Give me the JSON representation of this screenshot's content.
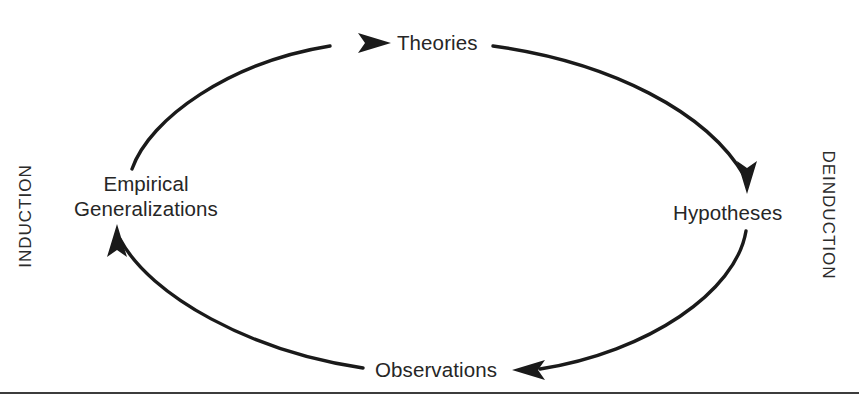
{
  "diagram": {
    "background_color": "#ffffff",
    "stroke_color": "#1a1a1a",
    "text_color": "#262626",
    "direction": "clockwise",
    "nodes": [
      {
        "id": "theories",
        "label": "Theories",
        "position": "top"
      },
      {
        "id": "hypotheses",
        "label": "Hypotheses",
        "position": "right"
      },
      {
        "id": "observations",
        "label": "Observations",
        "position": "bottom"
      },
      {
        "id": "empirical-generalizations",
        "label": "Empirical Generalizations",
        "line_1": "Empirical",
        "line_2": "Generalizations",
        "position": "left"
      }
    ],
    "side_labels": [
      {
        "id": "induction",
        "label": "INDUCTION",
        "side": "left",
        "rotation": -90
      },
      {
        "id": "deinduction",
        "label": "DEINDUCTION",
        "side": "right",
        "rotation": 90
      }
    ],
    "arrows": [
      {
        "id": "arrow-eg-to-theories",
        "from": "empirical-generalizations",
        "to": "theories"
      },
      {
        "id": "arrow-theories-to-hypotheses",
        "from": "theories",
        "to": "hypotheses"
      },
      {
        "id": "arrow-hypotheses-to-observations",
        "from": "hypotheses",
        "to": "observations"
      },
      {
        "id": "arrow-observations-to-eg",
        "from": "observations",
        "to": "empirical-generalizations"
      }
    ]
  }
}
